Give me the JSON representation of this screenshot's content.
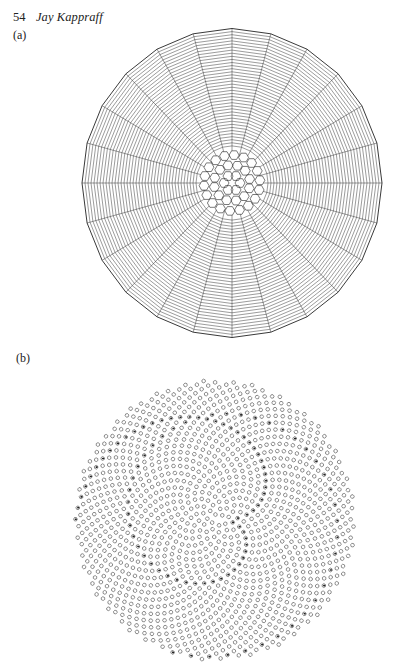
{
  "running_head": {
    "page_number": "54",
    "author": "Jay Kappraff"
  },
  "figures": [
    {
      "label": "(a)",
      "description": "Radial Voronoi-like tessellation of disk with spoke sectors and concentric cell rows",
      "center": [
        232,
        183
      ],
      "radius": 150,
      "sectors": 24,
      "stroke_color": "#222222"
    },
    {
      "label": "(b)",
      "description": "Phyllotaxis sunflower seed-head pattern of cells with marked seeds forming spirals",
      "center": [
        215,
        520
      ],
      "radius": 140,
      "cell_count": 1300,
      "divergence_angle_deg": 137.508,
      "stroke_color": "#222222"
    }
  ]
}
